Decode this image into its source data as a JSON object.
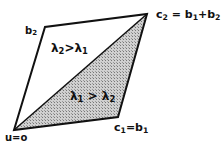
{
  "diagram": {
    "vertices": {
      "origin": {
        "label": "u=0",
        "x": 14,
        "y": 130
      },
      "b2": {
        "label": "b2",
        "x": 45,
        "y": 27
      },
      "c2": {
        "label": "c2 = b1 + b2",
        "x": 147,
        "y": 14
      },
      "c1": {
        "label": "c1 = b1",
        "x": 118,
        "y": 117
      }
    },
    "regions": {
      "upper": {
        "label": "λ2 > λ1",
        "fill": "#ffffff"
      },
      "lower": {
        "label": "λ1 > λ2",
        "fill": "hatched-gray"
      }
    },
    "labels": {
      "b2": "b",
      "b2_sub": "2",
      "c2_a": "c",
      "c2_a_sub": "2",
      "c2_eq": " = b",
      "c2_b_sub": "1",
      "c2_plus": "+b",
      "c2_c_sub": "2",
      "c1_a": "c",
      "c1_a_sub": "1",
      "c1_eq": "=b",
      "c1_b_sub": "1",
      "origin": "u=o",
      "upper_l": "λ",
      "upper_l_sub": "2",
      "upper_gt": ">λ",
      "upper_r_sub": "1",
      "lower_l": "λ",
      "lower_l_sub": "1",
      "lower_gt": " > λ",
      "lower_r_sub": "2"
    },
    "colors": {
      "stroke": "#111111",
      "shade": "#b8b8b8"
    }
  }
}
